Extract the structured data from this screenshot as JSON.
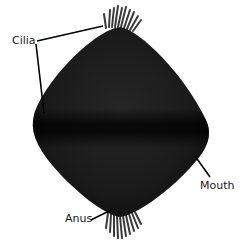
{
  "diagram": {
    "colors": {
      "background": "#ffffff",
      "body": "#1c1c1c",
      "body_band": "#050505",
      "cilia": "#3a3a3a",
      "leader_line": "#000000",
      "label_text": "#1a1a1a"
    },
    "labels": {
      "cilia": "Cilia",
      "mouth": "Mouth",
      "anus": "Anus"
    }
  }
}
